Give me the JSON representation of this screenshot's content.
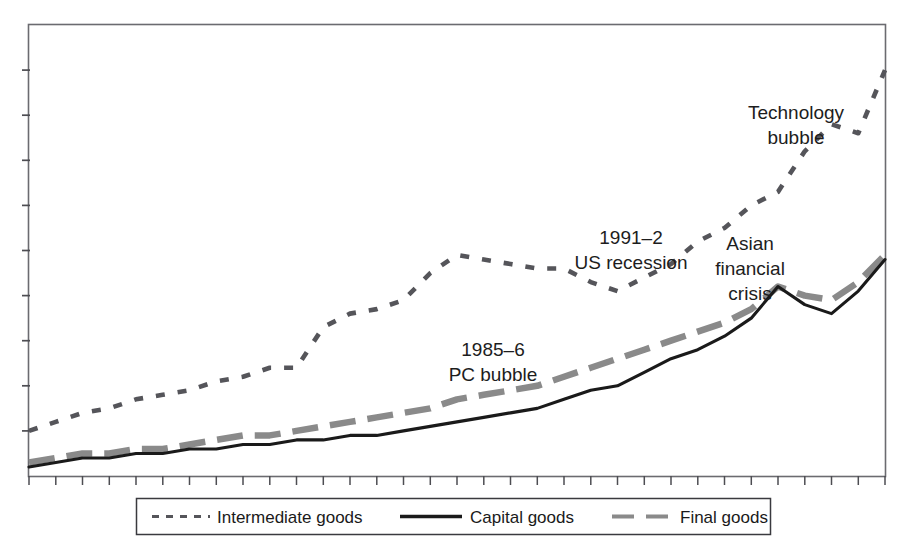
{
  "chart_data": {
    "type": "line",
    "title": "",
    "subtitle": "",
    "xlabel": "",
    "ylabel": "",
    "grid": false,
    "legend_position": "bottom-center",
    "axis": {
      "x_tick_count": 33,
      "y_tick_count": 9,
      "x_tick_labels": [],
      "y_tick_labels": [],
      "xlim": [
        0,
        32
      ],
      "ylim": [
        0,
        100
      ],
      "frame": "full-box"
    },
    "series": [
      {
        "name": "Intermediate goods",
        "style": "fine-dashed",
        "color": "#55555a",
        "x": [
          0,
          1,
          2,
          3,
          4,
          5,
          6,
          7,
          8,
          9,
          10,
          11,
          12,
          13,
          14,
          15,
          16,
          17,
          18,
          19,
          20,
          21,
          22,
          23,
          24,
          25,
          26,
          27,
          28,
          29,
          30,
          31,
          32
        ],
        "values": [
          10,
          12,
          14,
          15,
          17,
          18,
          19,
          21,
          22,
          24,
          24,
          33,
          36,
          37,
          39,
          45,
          49,
          48,
          47,
          46,
          46,
          43,
          41,
          44,
          47,
          52,
          55,
          60,
          63,
          72,
          78,
          76,
          90
        ]
      },
      {
        "name": "Capital goods",
        "style": "solid",
        "color": "#1a1a1a",
        "x": [
          0,
          1,
          2,
          3,
          4,
          5,
          6,
          7,
          8,
          9,
          10,
          11,
          12,
          13,
          14,
          15,
          16,
          17,
          18,
          19,
          20,
          21,
          22,
          23,
          24,
          25,
          26,
          27,
          28,
          29,
          30,
          31,
          32
        ],
        "values": [
          2,
          3,
          4,
          4,
          5,
          5,
          6,
          6,
          7,
          7,
          8,
          8,
          9,
          9,
          10,
          11,
          12,
          13,
          14,
          15,
          17,
          19,
          20,
          23,
          26,
          28,
          31,
          35,
          42,
          38,
          36,
          41,
          48
        ]
      },
      {
        "name": "Final goods",
        "style": "long-dashed",
        "color": "#8a8a8a",
        "x": [
          0,
          1,
          2,
          3,
          4,
          5,
          6,
          7,
          8,
          9,
          10,
          11,
          12,
          13,
          14,
          15,
          16,
          17,
          18,
          19,
          20,
          21,
          22,
          23,
          24,
          25,
          26,
          27,
          28,
          29,
          30,
          31,
          32
        ],
        "values": [
          3,
          4,
          5,
          5,
          6,
          6,
          7,
          8,
          9,
          9,
          10,
          11,
          12,
          13,
          14,
          15,
          17,
          18,
          19,
          20,
          22,
          24,
          26,
          28,
          30,
          32,
          34,
          37,
          42,
          40,
          39,
          43,
          49
        ]
      }
    ],
    "annotations": [
      {
        "id": "pc-bubble",
        "text_lines": [
          "1985–6",
          "PC bubble"
        ],
        "align": "middle",
        "x": 493,
        "y": 356
      },
      {
        "id": "us-recession",
        "text_lines": [
          "1991–2",
          "US recession"
        ],
        "align": "middle",
        "x": 631,
        "y": 244
      },
      {
        "id": "asian-crisis",
        "text_lines": [
          "Asian",
          "financial",
          "crisis"
        ],
        "align": "middle",
        "x": 750,
        "y": 250
      },
      {
        "id": "technology-bubble",
        "text_lines": [
          "Technology",
          "bubble"
        ],
        "align": "middle",
        "x": 796,
        "y": 119
      }
    ]
  },
  "legend": {
    "items": [
      {
        "label": "Intermediate goods",
        "marker": "fine-dashed"
      },
      {
        "label": "Capital goods",
        "marker": "solid"
      },
      {
        "label": "Final goods",
        "marker": "long-dashed"
      }
    ]
  },
  "colors": {
    "axis": "#6b6b70",
    "intermediate": "#55555a",
    "capital": "#1a1a1a",
    "final": "#8a8a8a",
    "background": "#ffffff",
    "text": "#1a1a1a"
  }
}
